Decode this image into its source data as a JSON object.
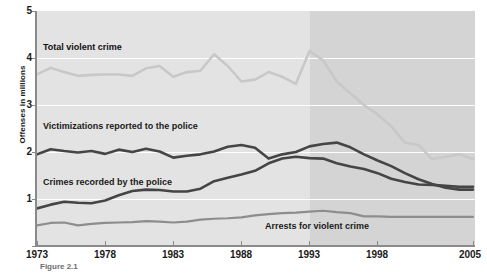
{
  "figure": {
    "caption": "Figure 2.1"
  },
  "axes": {
    "ylabel": "Offenses in millions",
    "yticks": [
      "1",
      "2",
      "3",
      "4",
      "5"
    ],
    "xticks": [
      "1973",
      "1978",
      "1983",
      "1988",
      "1993",
      "1998",
      "2005"
    ]
  },
  "series_labels": {
    "total": "Total violent crime",
    "victimizations": "Victimizations reported to the police",
    "recorded": "Crimes recorded by the police",
    "arrests": "Arrests for violent crime"
  },
  "colors": {
    "plot_background": "#e3e3e3",
    "shaded_band": "#d4d4d4",
    "gridline": "#ffffff",
    "axis": "#8a8a8a",
    "total_violent_crime": "#c8c8c8",
    "victimizations": "#454545",
    "crimes_recorded": "#454545",
    "arrests": "#8d8d8d",
    "text": "#1a1a1a"
  },
  "chart_data": {
    "type": "line",
    "title": "",
    "xlabel": "",
    "ylabel": "Offenses in millions",
    "xlim": [
      1973,
      2005
    ],
    "ylim": [
      0,
      5
    ],
    "grid": true,
    "legend": "inline-annotations",
    "shaded_region": {
      "start": 1993,
      "end": 2005,
      "note": "darker background band from 1993 onward"
    },
    "x": [
      1973,
      1974,
      1975,
      1976,
      1977,
      1978,
      1979,
      1980,
      1981,
      1982,
      1983,
      1984,
      1985,
      1986,
      1987,
      1988,
      1989,
      1990,
      1991,
      1992,
      1993,
      1994,
      1995,
      1996,
      1997,
      1998,
      1999,
      2000,
      2001,
      2002,
      2003,
      2004,
      2005
    ],
    "series": [
      {
        "name": "Total violent crime",
        "color": "#c8c8c8",
        "values": [
          3.65,
          3.79,
          3.7,
          3.62,
          3.64,
          3.65,
          3.65,
          3.62,
          3.78,
          3.83,
          3.6,
          3.7,
          3.73,
          4.08,
          3.83,
          3.5,
          3.54,
          3.7,
          3.6,
          3.45,
          4.15,
          3.95,
          3.5,
          3.25,
          3.0,
          2.8,
          2.55,
          2.2,
          2.15,
          1.85,
          1.9,
          1.95,
          1.85
        ]
      },
      {
        "name": "Victimizations reported to the police",
        "color": "#454545",
        "values": [
          1.95,
          2.06,
          2.02,
          1.99,
          2.02,
          1.96,
          2.05,
          2.0,
          2.07,
          2.01,
          1.88,
          1.92,
          1.95,
          2.01,
          2.11,
          2.15,
          2.09,
          1.86,
          1.95,
          2.0,
          2.12,
          2.17,
          2.2,
          2.1,
          1.95,
          1.82,
          1.7,
          1.55,
          1.42,
          1.32,
          1.24,
          1.2,
          1.2
        ]
      },
      {
        "name": "Crimes recorded by the police",
        "color": "#454545",
        "values": [
          0.8,
          0.88,
          0.94,
          0.92,
          0.91,
          0.97,
          1.08,
          1.17,
          1.2,
          1.19,
          1.16,
          1.16,
          1.22,
          1.38,
          1.45,
          1.52,
          1.6,
          1.76,
          1.86,
          1.9,
          1.87,
          1.86,
          1.76,
          1.69,
          1.64,
          1.55,
          1.43,
          1.36,
          1.31,
          1.3,
          1.28,
          1.26,
          1.26
        ]
      },
      {
        "name": "Arrests for violent crime",
        "color": "#8d8d8d",
        "values": [
          0.44,
          0.49,
          0.5,
          0.44,
          0.47,
          0.49,
          0.5,
          0.51,
          0.53,
          0.52,
          0.5,
          0.52,
          0.56,
          0.58,
          0.59,
          0.61,
          0.65,
          0.68,
          0.7,
          0.71,
          0.73,
          0.75,
          0.72,
          0.7,
          0.63,
          0.63,
          0.62,
          0.62,
          0.62,
          0.62,
          0.62,
          0.62,
          0.62
        ]
      }
    ]
  }
}
